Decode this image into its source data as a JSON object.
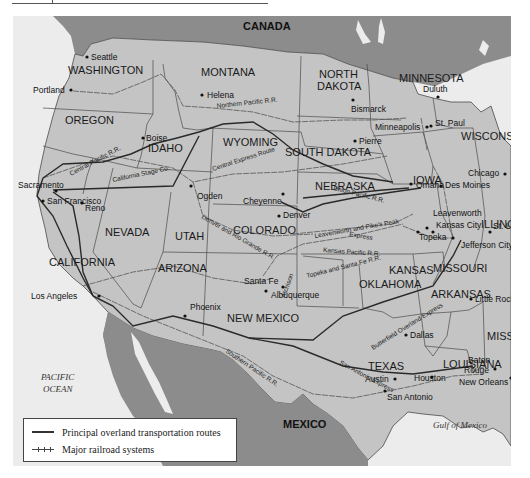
{
  "map": {
    "countries": [
      {
        "name": "CANADA"
      },
      {
        "name": "MEXICO"
      }
    ],
    "water_bodies": [
      {
        "name": "PACIFIC",
        "line2": "OCEAN"
      },
      {
        "name": "Gulf of Mexico"
      }
    ],
    "states": [
      "WASHINGTON",
      "OREGON",
      "CALIFORNIA",
      "NEVADA",
      "IDAHO",
      "MONTANA",
      "WYOMING",
      "UTAH",
      "ARIZONA",
      "COLORADO",
      "NEW MEXICO",
      "NORTH",
      "DAKOTA",
      "SOUTH DAKOTA",
      "NEBRASKA",
      "KANSAS",
      "OKLAHOMA",
      "TEXAS",
      "MINNESOTA",
      "IOWA",
      "MISSOURI",
      "ARKANSAS",
      "LOUISIANA",
      "WISCONSIN",
      "ILLINOIS",
      "MISS."
    ],
    "cities": [
      "Seattle",
      "Portland",
      "Helena",
      "Boise",
      "Bismarck",
      "Duluth",
      "Minneapolis",
      "St. Paul",
      "Pierre",
      "Sacramento",
      "San Francisco",
      "Reno",
      "Ogden",
      "Cheyenne",
      "Denver",
      "Omaha",
      "Des Moines",
      "Chicago",
      "Leavenworth",
      "Kansas City",
      "Topeka",
      "St. Louis",
      "Jefferson City",
      "Santa Fe",
      "Albuquerque",
      "Los Angeles",
      "Phoenix",
      "Little Rock",
      "Dallas",
      "Austin",
      "Houston",
      "San Antonio",
      "Baton",
      "Rouge",
      "New Orleans"
    ],
    "routes": [
      "Northern Pacific R.R.",
      "Central Pacific R.R.",
      "California Stage Co.",
      "Central Express Route",
      "Union Pacific R.R.",
      "Leavenworth and Pike's Peak",
      "Express",
      "Kansas Pacific R.R.",
      "Topeka and Santa Fe R.R.",
      "Denver and Rio Grande R.R.",
      "Atchison",
      "Butterfield Overland Express",
      "San Antonio Express",
      "Southern Pacific R.R."
    ]
  },
  "legend": {
    "items": [
      {
        "symbol": "solid-line",
        "label": "Principal overland transportation routes"
      },
      {
        "symbol": "tick-line",
        "label": "Major railroad systems"
      }
    ]
  },
  "colors": {
    "land_us": "#c4c4c4",
    "land_foreign": "#8c8c8c",
    "water": "#ececec",
    "borders": "#4a4a4a",
    "routes": "#2a2a2a"
  }
}
